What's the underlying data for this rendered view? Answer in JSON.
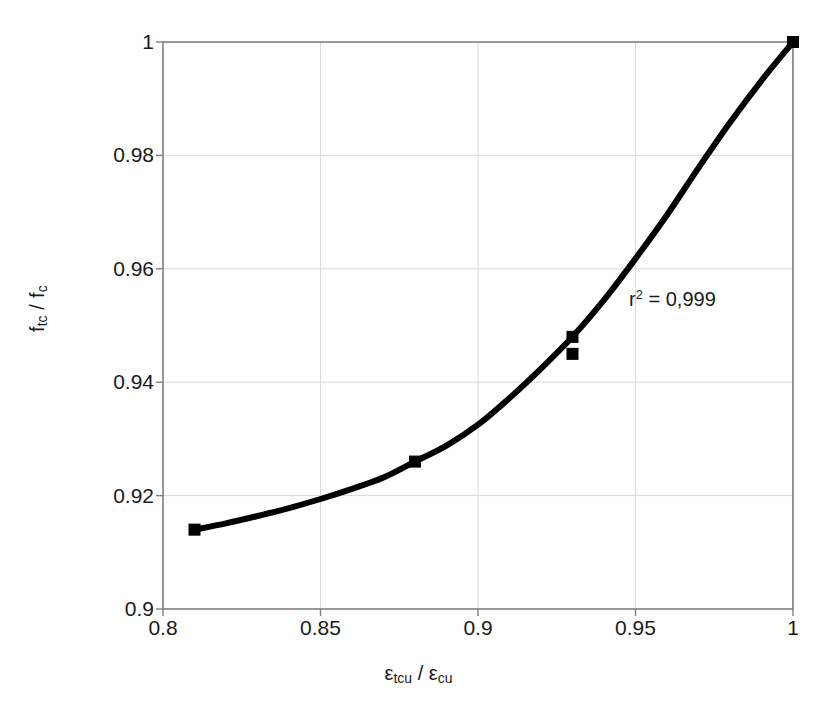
{
  "chart_data": {
    "type": "scatter",
    "title": "",
    "subtitle": "",
    "xlabel": "εtcu / εcu",
    "xlabel_parts": {
      "base1": "ε",
      "sub1": "tcu",
      "sep": " / ",
      "base2": "ε",
      "sub2": "cu"
    },
    "ylabel": "ftc / fc",
    "ylabel_parts": {
      "base1": "f",
      "sub1": "tc",
      "sep": " / ",
      "base2": "f",
      "sub2": "c"
    },
    "xlim": [
      0.8,
      1.0
    ],
    "ylim": [
      0.9,
      1.0
    ],
    "xticks": [
      0.8,
      0.85,
      0.9,
      0.95,
      1
    ],
    "yticks": [
      0.9,
      0.92,
      0.94,
      0.96,
      0.98,
      1
    ],
    "xtick_labels": [
      "0.8",
      "0.85",
      "0.9",
      "0.95",
      "1"
    ],
    "ytick_labels": [
      "0.9",
      "0.92",
      "0.94",
      "0.96",
      "0.98",
      "1"
    ],
    "grid": true,
    "legend": "none",
    "series": [
      {
        "name": "data-points",
        "marker": "square",
        "marker_color": "#000000",
        "points": [
          {
            "x": 0.81,
            "y": 0.914
          },
          {
            "x": 0.88,
            "y": 0.926
          },
          {
            "x": 0.93,
            "y": 0.948
          },
          {
            "x": 0.93,
            "y": 0.945
          },
          {
            "x": 1.0,
            "y": 1.0
          }
        ]
      },
      {
        "name": "fitted-curve",
        "marker": "none",
        "line_color": "#000000",
        "line_width": 6,
        "points": [
          {
            "x": 0.81,
            "y": 0.914
          },
          {
            "x": 0.82,
            "y": 0.9151
          },
          {
            "x": 0.83,
            "y": 0.9164
          },
          {
            "x": 0.84,
            "y": 0.9178
          },
          {
            "x": 0.85,
            "y": 0.9194
          },
          {
            "x": 0.86,
            "y": 0.9212
          },
          {
            "x": 0.87,
            "y": 0.9232
          },
          {
            "x": 0.88,
            "y": 0.926
          },
          {
            "x": 0.89,
            "y": 0.9288
          },
          {
            "x": 0.9,
            "y": 0.9325
          },
          {
            "x": 0.91,
            "y": 0.9372
          },
          {
            "x": 0.92,
            "y": 0.9424
          },
          {
            "x": 0.93,
            "y": 0.948
          },
          {
            "x": 0.94,
            "y": 0.9545
          },
          {
            "x": 0.95,
            "y": 0.9618
          },
          {
            "x": 0.96,
            "y": 0.9695
          },
          {
            "x": 0.97,
            "y": 0.9778
          },
          {
            "x": 0.98,
            "y": 0.9858
          },
          {
            "x": 0.99,
            "y": 0.9932
          },
          {
            "x": 1.0,
            "y": 1.0
          }
        ]
      }
    ],
    "annotations": [
      {
        "id": "r-squared",
        "text_prefix": "r",
        "text_sup": "2",
        "text_suffix": " = 0,999",
        "text": "r2 = 0,999",
        "x": 0.935,
        "y": 0.9545
      }
    ],
    "colors": {
      "plot_border": "#7f7f7f",
      "gridline": "#d9d9d9",
      "data": "#000000",
      "background": "#ffffff",
      "text": "#1a1a1a"
    }
  },
  "axis_geometry": {
    "plot_left": 163,
    "plot_right": 793,
    "plot_top": 42,
    "plot_bottom": 609
  }
}
